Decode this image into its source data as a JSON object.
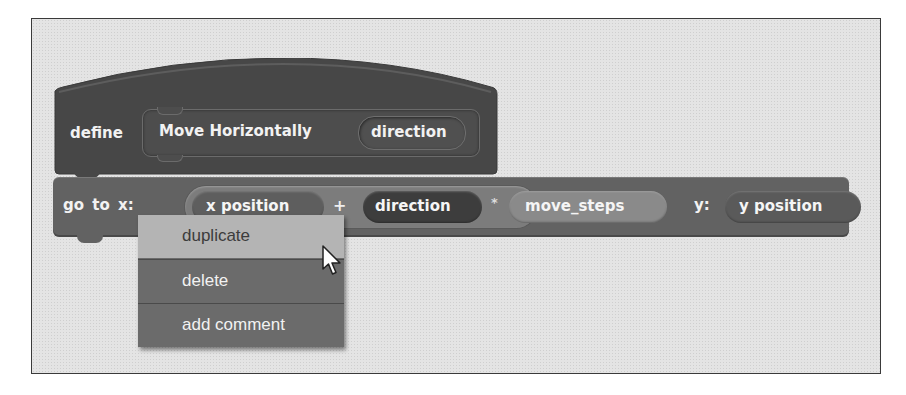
{
  "define_block": {
    "keyword": "define",
    "prototype_label": "Move Horizontally",
    "parameter": "direction"
  },
  "goto_block": {
    "label": "go to x:",
    "x_expression": {
      "left": "x position",
      "operator1": "+",
      "middle": "direction",
      "operator2": "*",
      "right": "move_steps"
    },
    "y_label": "y:",
    "y_value": "y position"
  },
  "context_menu": {
    "items": [
      {
        "label": "duplicate",
        "highlighted": true
      },
      {
        "label": "delete",
        "highlighted": false
      },
      {
        "label": "add comment",
        "highlighted": false
      }
    ]
  },
  "cursor": {
    "icon": "arrow-pointer-icon"
  },
  "colors": {
    "canvas": "#e4e4e4",
    "define_block": "#474747",
    "goto_block": "#626262",
    "menu_bg": "#6b6b6b",
    "menu_highlight": "#b4b4b4"
  }
}
